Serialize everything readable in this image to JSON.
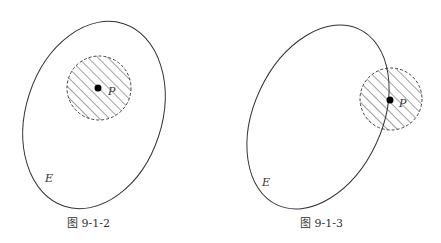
{
  "figures": [
    {
      "id": "fig-left",
      "caption": "图 9-1-2",
      "set_label": "E",
      "point_label": "P",
      "description": "Point P with shaded neighborhood entirely inside set E (interior point)"
    },
    {
      "id": "fig-right",
      "caption": "图 9-1-3",
      "set_label": "E",
      "point_label": "P",
      "description": "Point P on the boundary of E; its neighborhood contains points both inside and outside E (boundary point)"
    }
  ],
  "colors": {
    "stroke": "#333333",
    "background": "#ffffff"
  }
}
